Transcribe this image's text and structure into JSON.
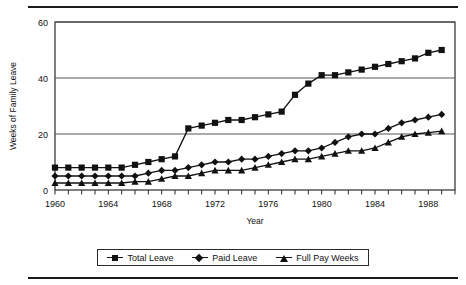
{
  "chart_data": {
    "type": "line",
    "title": "",
    "xlabel": "Year",
    "ylabel": "Weeks of Family Leave",
    "xlim": [
      1960,
      1990
    ],
    "ylim": [
      0,
      60
    ],
    "yticks": [
      0,
      20,
      40,
      60
    ],
    "xticks": [
      1960,
      1964,
      1968,
      1972,
      1976,
      1980,
      1984,
      1988
    ],
    "xtick_labels": [
      "1960",
      "1964",
      "1968",
      "1972",
      "1976",
      "1980",
      "1984",
      "1988"
    ],
    "ytick_labels": [
      "0",
      "20",
      "40",
      "60"
    ],
    "grid": "horizontal",
    "legend_position": "bottom",
    "x": [
      1960,
      1961,
      1962,
      1963,
      1964,
      1965,
      1966,
      1967,
      1968,
      1969,
      1970,
      1971,
      1972,
      1973,
      1974,
      1975,
      1976,
      1977,
      1978,
      1979,
      1980,
      1981,
      1982,
      1983,
      1984,
      1985,
      1986,
      1987,
      1988,
      1989
    ],
    "series": [
      {
        "name": "Total Leave",
        "marker": "square",
        "values": [
          8,
          8,
          8,
          8,
          8,
          8,
          9,
          10,
          11,
          12,
          22,
          23,
          24,
          25,
          25,
          26,
          27,
          28,
          34,
          38,
          41,
          41,
          42,
          43,
          44,
          45,
          46,
          47,
          49,
          50
        ]
      },
      {
        "name": "Paid Leave",
        "marker": "diamond",
        "values": [
          5,
          5,
          5,
          5,
          5,
          5,
          5,
          6,
          7,
          7,
          8,
          9,
          10,
          10,
          11,
          11,
          12,
          13,
          14,
          14,
          15,
          17,
          19,
          20,
          20,
          22,
          24,
          25,
          26,
          27
        ]
      },
      {
        "name": "Full Pay Weeks",
        "marker": "triangle",
        "values": [
          2.5,
          2.5,
          2.5,
          2.5,
          2.5,
          2.5,
          3,
          3,
          4,
          5,
          5,
          6,
          7,
          7,
          7,
          8,
          9,
          10,
          11,
          11,
          12,
          13,
          14,
          14,
          15,
          17,
          19,
          20,
          20.5,
          21
        ]
      }
    ]
  },
  "legend": {
    "items": [
      {
        "label": "Total Leave",
        "marker": "square"
      },
      {
        "label": "Paid Leave",
        "marker": "diamond"
      },
      {
        "label": "Full Pay Weeks",
        "marker": "triangle"
      }
    ]
  }
}
